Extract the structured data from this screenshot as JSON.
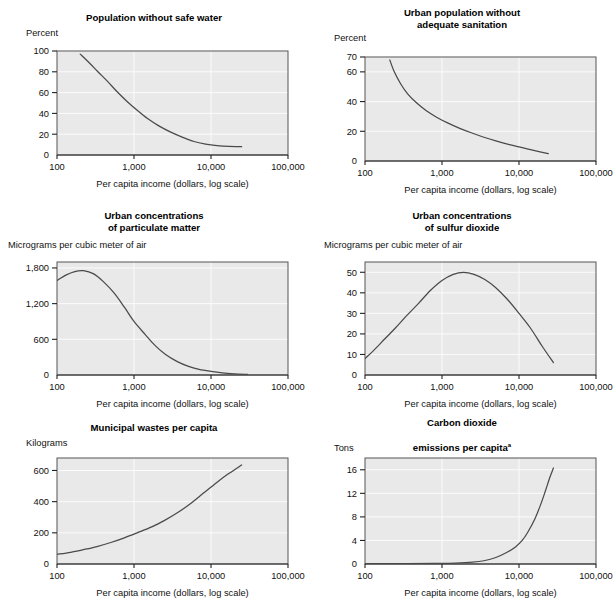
{
  "common": {
    "x_caption": "Per capita income (dollars, log scale)",
    "x_ticks": [
      "100",
      "1,000",
      "10,000",
      "100,000"
    ],
    "curve_color": "#4a4a4a",
    "plot_bg": "#e9e9e9",
    "grid_color": "#fbfbfb",
    "border_color": "#555555",
    "text_color": "#111111"
  },
  "chart_data": [
    {
      "id": "safe-water",
      "type": "line",
      "title": "Population without safe water",
      "title_lines": [
        "Population without safe water"
      ],
      "ylabel": "Percent",
      "xlabel": "Per capita income (dollars, log scale)",
      "xlim": [
        100,
        100000
      ],
      "xlog": true,
      "xticks": [
        100,
        1000,
        10000,
        100000
      ],
      "xticklabels": [
        "100",
        "1,000",
        "10,000",
        "100,000"
      ],
      "ylim": [
        0,
        100
      ],
      "yticks": [
        0,
        20,
        40,
        60,
        80,
        100
      ],
      "yticklabels": [
        "0",
        "20",
        "40",
        "60",
        "80",
        "100"
      ],
      "grid": true,
      "legend": "none",
      "series": [
        {
          "name": "percent without safe water",
          "x": [
            200,
            260,
            340,
            450,
            600,
            800,
            1100,
            1500,
            2100,
            3000,
            4300,
            6000,
            8500,
            12000,
            17000,
            25000
          ],
          "y": [
            97,
            89,
            80,
            71,
            61,
            52,
            43,
            35,
            28,
            22,
            17,
            13,
            10.5,
            9,
            8.2,
            8
          ]
        }
      ]
    },
    {
      "id": "sanitation",
      "type": "line",
      "title": "Urban population without adequate sanitation",
      "title_lines": [
        "Urban population without",
        "adequate sanitation"
      ],
      "ylabel": "Percent",
      "xlabel": "Per capita income (dollars, log scale)",
      "xlim": [
        100,
        100000
      ],
      "xlog": true,
      "xticks": [
        100,
        1000,
        10000,
        100000
      ],
      "xticklabels": [
        "100",
        "1,000",
        "10,000",
        "100,000"
      ],
      "ylim": [
        0,
        70
      ],
      "yticks": [
        0,
        20,
        40,
        60
      ],
      "yticklabels": [
        "0",
        "20",
        "40",
        "60"
      ],
      "ytick_extra": [
        70
      ],
      "ytick_extra_labels": [
        "70"
      ],
      "grid": true,
      "legend": "none",
      "series": [
        {
          "name": "urban percent without sanitation",
          "x": [
            210,
            240,
            290,
            360,
            470,
            620,
            850,
            1200,
            1700,
            2400,
            3500,
            5000,
            7500,
            11000,
            16000,
            24000
          ],
          "y": [
            68,
            60,
            52,
            45,
            39,
            34,
            29.5,
            25.5,
            22,
            19,
            16,
            13.5,
            11,
            9,
            7,
            5
          ]
        }
      ]
    },
    {
      "id": "particulate-matter",
      "type": "line",
      "title": "Urban concentrations of particulate matter",
      "title_lines": [
        "Urban concentrations",
        "of particulate matter"
      ],
      "ylabel": "Micrograms per cubic meter of air",
      "xlabel": "Per capita income (dollars, log scale)",
      "xlim": [
        100,
        100000
      ],
      "xlog": true,
      "xticks": [
        100,
        1000,
        10000,
        100000
      ],
      "xticklabels": [
        "100",
        "1,000",
        "10,000",
        "100,000"
      ],
      "ylim": [
        0,
        1900
      ],
      "yticks": [
        0,
        600,
        1200,
        1800
      ],
      "yticklabels": [
        "0",
        "600",
        "1,200",
        "1,800"
      ],
      "grid": true,
      "legend": "none",
      "series": [
        {
          "name": "particulate concentration",
          "x": [
            100,
            130,
            170,
            220,
            300,
            400,
            550,
            750,
            1000,
            1400,
            1900,
            2600,
            3600,
            5000,
            7000,
            10000,
            14000,
            20000,
            30000
          ],
          "y": [
            1590,
            1680,
            1740,
            1755,
            1700,
            1570,
            1380,
            1140,
            900,
            680,
            490,
            340,
            230,
            150,
            95,
            60,
            35,
            20,
            10
          ]
        }
      ]
    },
    {
      "id": "sulfur-dioxide",
      "type": "line",
      "title": "Urban concentrations of sulfur dioxide",
      "title_lines": [
        "Urban concentrations",
        "of sulfur dioxide"
      ],
      "ylabel": "Micrograms per cubic meter of air",
      "xlabel": "Per capita income (dollars, log scale)",
      "xlim": [
        100,
        100000
      ],
      "xlog": true,
      "xticks": [
        100,
        1000,
        10000,
        100000
      ],
      "xticklabels": [
        "100",
        "1,000",
        "10,000",
        "100,000"
      ],
      "ylim": [
        0,
        55
      ],
      "yticks": [
        0,
        10,
        20,
        30,
        40,
        50
      ],
      "yticklabels": [
        "0",
        "10",
        "20",
        "30",
        "40",
        "50"
      ],
      "grid": true,
      "legend": "none",
      "series": [
        {
          "name": "sulfur dioxide concentration",
          "x": [
            100,
            130,
            180,
            250,
            350,
            500,
            700,
            1000,
            1400,
            1900,
            2600,
            3600,
            5000,
            7000,
            10000,
            14000,
            20000,
            28000
          ],
          "y": [
            8,
            12,
            17.5,
            23,
            29,
            35,
            41,
            46,
            49,
            50,
            49,
            46.5,
            42.5,
            37,
            30,
            23,
            14,
            6
          ]
        }
      ]
    },
    {
      "id": "municipal-wastes",
      "type": "line",
      "title": "Municipal wastes per capita",
      "title_lines": [
        "Municipal wastes per capita"
      ],
      "ylabel": "Kilograms",
      "xlabel": "Per capita income (dollars, log scale)",
      "xlim": [
        100,
        100000
      ],
      "xlog": true,
      "xticks": [
        100,
        1000,
        10000,
        100000
      ],
      "xticklabels": [
        "100",
        "1,000",
        "10,000",
        "100,000"
      ],
      "ylim": [
        0,
        680
      ],
      "yticks": [
        0,
        200,
        400,
        600
      ],
      "yticklabels": [
        "0",
        "200",
        "400",
        "600"
      ],
      "grid": true,
      "legend": "none",
      "series": [
        {
          "name": "municipal waste per capita",
          "x": [
            100,
            150,
            220,
            330,
            500,
            750,
            1100,
            1700,
            2500,
            3700,
            5500,
            8000,
            12000,
            17000,
            25000
          ],
          "y": [
            62,
            75,
            92,
            112,
            138,
            168,
            200,
            238,
            280,
            330,
            390,
            455,
            525,
            580,
            635
          ]
        }
      ]
    },
    {
      "id": "carbon-dioxide",
      "type": "line",
      "title": "Carbon dioxide emissions per capita",
      "title_lines": [
        "Carbon dioxide",
        "emissions per capita"
      ],
      "title_footnote": "a",
      "ylabel": "Tons",
      "xlabel": "Per capita income (dollars, log scale)",
      "xlim": [
        100,
        100000
      ],
      "xlog": true,
      "xticks": [
        100,
        1000,
        10000,
        100000
      ],
      "xticklabels": [
        "100",
        "1,000",
        "10,000",
        "100,000"
      ],
      "ylim": [
        0,
        18
      ],
      "yticks": [
        0,
        4,
        8,
        12,
        16
      ],
      "yticklabels": [
        "0",
        "4",
        "8",
        "12",
        "16"
      ],
      "grid": true,
      "legend": "none",
      "series": [
        {
          "name": "co2 emissions per capita",
          "x": [
            100,
            300,
            800,
            1500,
            2500,
            3500,
            5000,
            7000,
            9000,
            11000,
            13000,
            16000,
            19000,
            22000,
            25000,
            28000
          ],
          "y": [
            0.05,
            0.07,
            0.1,
            0.15,
            0.3,
            0.55,
            1.1,
            2.0,
            2.9,
            4.0,
            5.4,
            7.6,
            10.0,
            12.4,
            14.6,
            16.3
          ]
        }
      ]
    }
  ]
}
